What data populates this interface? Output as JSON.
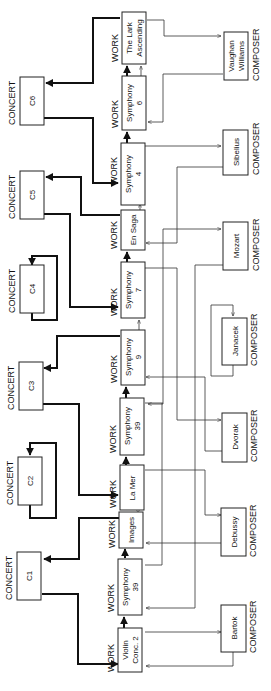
{
  "diagram": {
    "orientation": "rotated 90deg counter-clockwise",
    "type_labels": {
      "concert": "CONCERT",
      "work": "WORK",
      "composer": "COMPOSER"
    },
    "concerts": [
      {
        "id": "C6",
        "label": "C6"
      },
      {
        "id": "C5",
        "label": "C5"
      },
      {
        "id": "C4",
        "label": "C4"
      },
      {
        "id": "C3",
        "label": "C3"
      },
      {
        "id": "C2",
        "label": "C2"
      },
      {
        "id": "C1",
        "label": "C1"
      }
    ],
    "works": [
      {
        "id": "lark",
        "line1": "The Lark",
        "line2": "Ascending"
      },
      {
        "id": "sym6",
        "line1": "Symphony",
        "line2": "6"
      },
      {
        "id": "sym4",
        "line1": "Symphony",
        "line2": "4"
      },
      {
        "id": "ensaga",
        "line1": "En Saga",
        "line2": ""
      },
      {
        "id": "sym7",
        "line1": "Symphony",
        "line2": "7"
      },
      {
        "id": "sym9",
        "line1": "Symphony",
        "line2": "9"
      },
      {
        "id": "sym39a",
        "line1": "Symphony",
        "line2": "39"
      },
      {
        "id": "lamer",
        "line1": "La Mer",
        "line2": ""
      },
      {
        "id": "images",
        "line1": "Images",
        "line2": ""
      },
      {
        "id": "sym39b",
        "line1": "Symphony",
        "line2": "39"
      },
      {
        "id": "violin",
        "line1": "Violin",
        "line2": "Conc. 2"
      }
    ],
    "composers": [
      {
        "id": "vw",
        "line1": "Vaughan",
        "line2": "Williams"
      },
      {
        "id": "sibelius",
        "line1": "Sibelius",
        "line2": ""
      },
      {
        "id": "mozart",
        "line1": "Mozart",
        "line2": ""
      },
      {
        "id": "janacek",
        "line1": "Janacek",
        "line2": ""
      },
      {
        "id": "dvorak",
        "line1": "Dvorak",
        "line2": ""
      },
      {
        "id": "debussy",
        "line1": "Debussy",
        "line2": ""
      },
      {
        "id": "bartok",
        "line1": "Bartok",
        "line2": ""
      }
    ],
    "concert_first_work": [
      {
        "from": "C1",
        "to": "violin"
      },
      {
        "from": "C2",
        "to": "C2"
      },
      {
        "from": "C3",
        "to": "lamer"
      },
      {
        "from": "C4",
        "to": "C4"
      },
      {
        "from": "C5",
        "to": "sym7"
      },
      {
        "from": "C6",
        "to": "sym4"
      }
    ],
    "concert_last_work": [
      {
        "from": "images",
        "to": "C1"
      },
      {
        "from": "sym9",
        "to": "C3"
      },
      {
        "from": "ensaga",
        "to": "C5"
      },
      {
        "from": "lark",
        "to": "C6"
      }
    ],
    "work_sequence": [
      [
        "violin",
        "sym39b"
      ],
      [
        "sym39b",
        "images"
      ],
      [
        "lamer",
        "sym39a"
      ],
      [
        "sym39a",
        "sym9"
      ],
      [
        "sym7",
        "ensaga"
      ],
      [
        "sym4",
        "sym6"
      ],
      [
        "sym6",
        "lark"
      ]
    ],
    "composer_links": [
      {
        "composer": "Vaughan Williams",
        "works": [
          "The Lark Ascending",
          "Symphony 6"
        ]
      },
      {
        "composer": "Sibelius",
        "works": [
          "Symphony 4",
          "En Saga"
        ]
      },
      {
        "composer": "Mozart",
        "works": [
          "Symphony 39",
          "Symphony 39"
        ]
      },
      {
        "composer": "Janacek",
        "works": []
      },
      {
        "composer": "Dvorak",
        "works": [
          "Symphony 7",
          "Symphony 9"
        ]
      },
      {
        "composer": "Debussy",
        "works": [
          "La Mer",
          "Images"
        ]
      },
      {
        "composer": "Bartok",
        "works": [
          "Violin Conc. 2"
        ]
      }
    ]
  }
}
